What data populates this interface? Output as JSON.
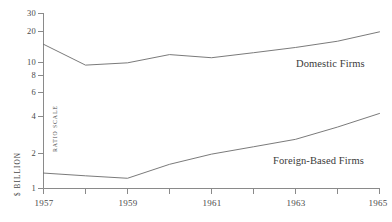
{
  "chart_data": {
    "type": "line",
    "title": "",
    "xlabel": "",
    "ylabel": "$ BILLION",
    "scale_note": "RATIO SCALE",
    "yscale": "log",
    "ylim": [
      1,
      30
    ],
    "xlim": [
      1957,
      1965
    ],
    "grid": false,
    "legend_position": "inline-right",
    "y_ticks": [
      1,
      2,
      4,
      6,
      8,
      10,
      20,
      30
    ],
    "y_tick_labels": [
      "1",
      "2",
      "4",
      "6",
      "8",
      "10",
      "20",
      "30"
    ],
    "x_ticks": [
      1957,
      1958,
      1959,
      1960,
      1961,
      1962,
      1963,
      1964,
      1965
    ],
    "x_tick_labels": [
      "1957",
      "",
      "1959",
      "",
      "1961",
      "",
      "1963",
      "",
      "1965"
    ],
    "x_major_labels": [
      "1957",
      "1959",
      "1961",
      "1963",
      "1965"
    ],
    "x": [
      1957,
      1958,
      1959,
      1960,
      1961,
      1962,
      1963,
      1964,
      1965
    ],
    "series": [
      {
        "name": "Domestic Firms",
        "values": [
          16.5,
          11.0,
          11.5,
          13.5,
          12.7,
          14.0,
          15.5,
          17.5,
          21.0
        ]
      },
      {
        "name": "Foreign-Based Firms",
        "values": [
          1.35,
          1.28,
          1.22,
          1.6,
          1.95,
          2.25,
          2.6,
          3.3,
          4.3
        ]
      }
    ]
  },
  "labels": {
    "domestic": "Domestic Firms",
    "foreign": "Foreign-Based Firms",
    "y_axis_title": "$ BILLION",
    "ratio_scale": "RATIO SCALE"
  },
  "ticks": {
    "y": [
      "30",
      "20",
      "10",
      "8",
      "6",
      "4",
      "2",
      "1"
    ],
    "x": [
      "1957",
      "1959",
      "1961",
      "1963",
      "1965"
    ]
  },
  "colors": {
    "line": "#6b6b6b",
    "axis": "#8a8a8a",
    "text": "#4a4a4a",
    "background": "#ffffff"
  }
}
